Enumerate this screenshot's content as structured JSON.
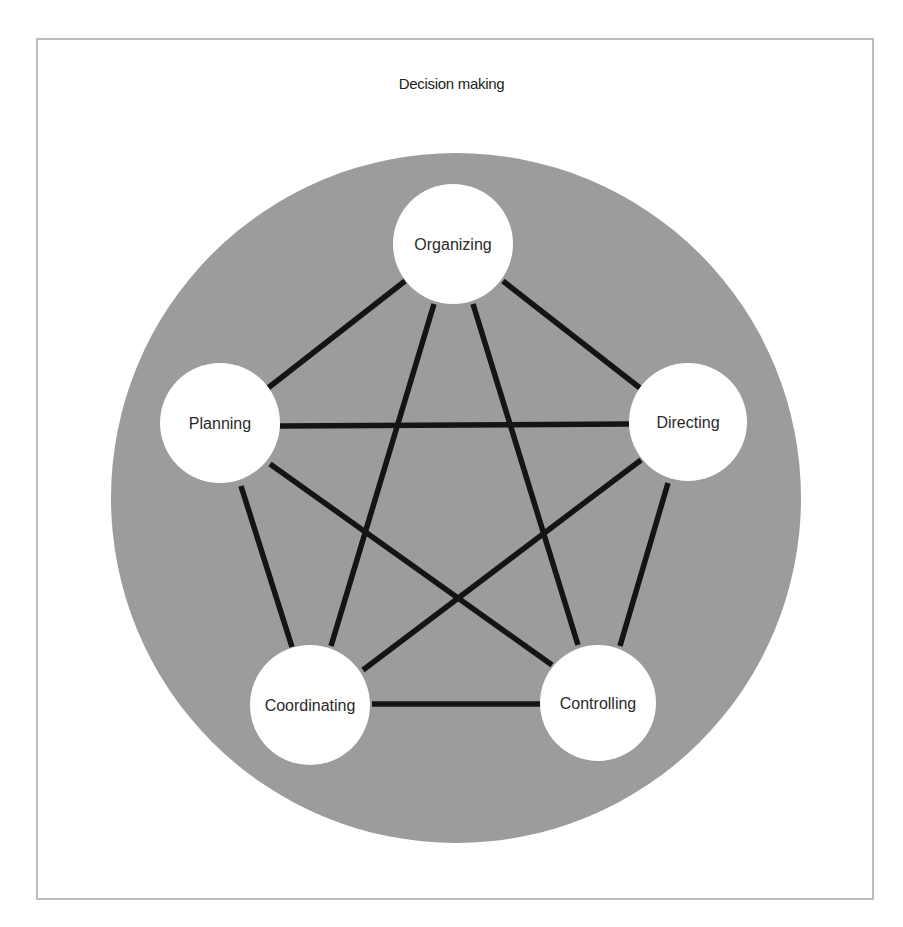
{
  "diagram": {
    "title": "Decision making",
    "colors": {
      "frame_border": "#bdbdbd",
      "background_disc": "#9c9c9c",
      "node_fill": "#ffffff",
      "edge": "#141414",
      "text": "#222222"
    },
    "nodes": [
      {
        "id": "organizing",
        "label": "Organizing",
        "cx": 453,
        "cy": 244,
        "r": 60
      },
      {
        "id": "planning",
        "label": "Planning",
        "cx": 220,
        "cy": 423,
        "r": 60
      },
      {
        "id": "directing",
        "label": "Directing",
        "cx": 688,
        "cy": 422,
        "r": 59
      },
      {
        "id": "coordinating",
        "label": "Coordinating",
        "cx": 310,
        "cy": 705,
        "r": 60
      },
      {
        "id": "controlling",
        "label": "Controlling",
        "cx": 598,
        "cy": 703,
        "r": 58
      }
    ],
    "edges": [
      {
        "from": "organizing",
        "to": "planning"
      },
      {
        "from": "organizing",
        "to": "directing"
      },
      {
        "from": "organizing",
        "to": "coordinating"
      },
      {
        "from": "organizing",
        "to": "controlling"
      },
      {
        "from": "planning",
        "to": "directing"
      },
      {
        "from": "planning",
        "to": "coordinating"
      },
      {
        "from": "planning",
        "to": "controlling"
      },
      {
        "from": "directing",
        "to": "coordinating"
      },
      {
        "from": "directing",
        "to": "controlling"
      },
      {
        "from": "coordinating",
        "to": "controlling"
      }
    ]
  }
}
